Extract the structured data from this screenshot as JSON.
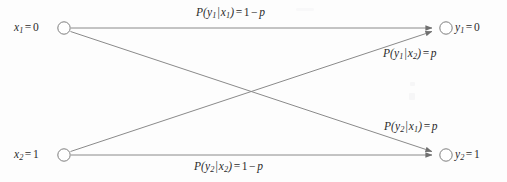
{
  "figure": {
    "type": "diagram",
    "background_color": "#fdfdfd",
    "line_color": "#8a8a8a",
    "text_color": "#2b2b2b",
    "node_fill": "#ffffff"
  },
  "nodes": [
    {
      "id": "x1",
      "side": "input",
      "label_full": "x1 = 0",
      "var": "x",
      "sub": "1",
      "eq": "=",
      "value": "0",
      "label_position": "left",
      "cx": 64,
      "cy": 28,
      "r": 6.2
    },
    {
      "id": "x2",
      "side": "input",
      "label_full": "x2 = 1",
      "var": "x",
      "sub": "2",
      "eq": "=",
      "value": "1",
      "label_position": "left",
      "cx": 64,
      "cy": 155,
      "r": 6.2
    },
    {
      "id": "y1",
      "side": "output",
      "label_full": "y1 = 0",
      "var": "y",
      "sub": "1",
      "eq": "=",
      "value": "0",
      "label_position": "right",
      "cx": 446,
      "cy": 28,
      "r": 6.2
    },
    {
      "id": "y2",
      "side": "output",
      "label_full": "y2 = 1",
      "var": "y",
      "sub": "2",
      "eq": "=",
      "value": "1",
      "label_position": "right",
      "cx": 446,
      "cy": 155,
      "r": 6.2
    }
  ],
  "edges": [
    {
      "id": "e-x1-y1",
      "from": "x1",
      "to": "y1",
      "kind": "straight",
      "arrowhead": true,
      "label": {
        "prefix": "P(",
        "num_var": "y",
        "num_sub": "1",
        "bar": "|",
        "den_var": "x",
        "den_sub": "1",
        "close": ")",
        "eq": "=",
        "value": "1 − p",
        "value_num": "1",
        "value_minus": "−",
        "value_p": "p",
        "full": "P(y1|x1) = 1 − p"
      }
    },
    {
      "id": "e-x2-y1",
      "from": "x2",
      "to": "y1",
      "kind": "diagonal",
      "arrowhead": true,
      "label": {
        "prefix": "P(",
        "num_var": "y",
        "num_sub": "1",
        "bar": "|",
        "den_var": "x",
        "den_sub": "2",
        "close": ")",
        "eq": "=",
        "value": "p",
        "value_p": "p",
        "full": "P(y1|x2) = p"
      }
    },
    {
      "id": "e-x1-y2",
      "from": "x1",
      "to": "y2",
      "kind": "diagonal",
      "arrowhead": true,
      "label": {
        "prefix": "P(",
        "num_var": "y",
        "num_sub": "2",
        "bar": "|",
        "den_var": "x",
        "den_sub": "1",
        "close": ")",
        "eq": "=",
        "value": "p",
        "value_p": "p",
        "full": "P(y2|x1) = p"
      }
    },
    {
      "id": "e-x2-y2",
      "from": "x2",
      "to": "y2",
      "kind": "straight",
      "arrowhead": true,
      "label": {
        "prefix": "P(",
        "num_var": "y",
        "num_sub": "2",
        "bar": "|",
        "den_var": "x",
        "den_sub": "2",
        "close": ")",
        "eq": "=",
        "value": "1 − p",
        "value_num": "1",
        "value_minus": "−",
        "value_p": "p",
        "full": "P(y2|x2) = 1 − p"
      }
    }
  ]
}
